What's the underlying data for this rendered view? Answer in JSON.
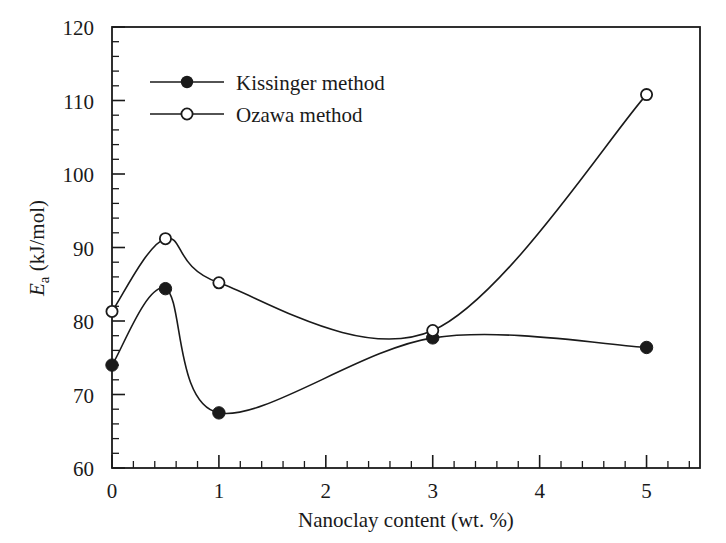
{
  "chart_data": {
    "type": "line",
    "title": "",
    "xlabel": "Nanoclay content (wt. %)",
    "ylabel": "Ea (kJ/mol)",
    "ylabel_parts": {
      "symbol": "E",
      "subscript": "a",
      "units": "(kJ/mol)"
    },
    "xlim": [
      0,
      5.5
    ],
    "ylim": [
      60,
      120
    ],
    "x_major_ticks": [
      0,
      1,
      2,
      3,
      4,
      5
    ],
    "x_tick_labels": [
      "0",
      "1",
      "2",
      "3",
      "4",
      "5"
    ],
    "x_minor_interval": 0.2,
    "y_major_ticks": [
      60,
      70,
      80,
      90,
      100,
      110,
      120
    ],
    "y_tick_labels": [
      "60",
      "70",
      "80",
      "90",
      "100",
      "110",
      "120"
    ],
    "y_minor_interval": 2,
    "grid": false,
    "legend_position": "upper left",
    "x": [
      0,
      0.5,
      1,
      3,
      5
    ],
    "series": [
      {
        "name": "Kissinger method",
        "marker": "filled-circle",
        "color": "#1a1a1a",
        "values": [
          74.0,
          84.4,
          67.5,
          77.7,
          76.4
        ]
      },
      {
        "name": "Ozawa method",
        "marker": "open-circle",
        "color": "#1a1a1a",
        "values": [
          81.3,
          91.2,
          85.2,
          78.7,
          110.8
        ]
      }
    ]
  },
  "legend": {
    "items": [
      {
        "label": "Kissinger method",
        "marker": "filled-circle"
      },
      {
        "label": "Ozawa method",
        "marker": "open-circle"
      }
    ]
  },
  "colors": {
    "foreground": "#1a1a1a",
    "background": "#ffffff"
  }
}
